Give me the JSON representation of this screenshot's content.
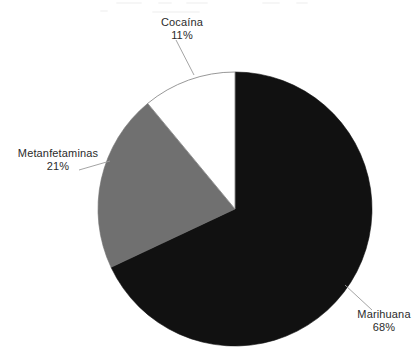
{
  "page": {
    "background_color": "#ffffff",
    "width": 419,
    "height": 359
  },
  "chart_data": {
    "type": "pie",
    "title": "",
    "subtitle": "",
    "xlabel": "",
    "ylabel": "",
    "legend_position": "none",
    "label_style": "outside-with-leader-lines",
    "start_angle_deg": 0,
    "direction": "clockwise",
    "center": {
      "x": 235,
      "y": 209
    },
    "radius": 137,
    "categories": [
      "Marihuana",
      "Metanfetaminas",
      "Cocaína"
    ],
    "values": [
      68,
      21,
      11
    ],
    "value_unit": "%",
    "value_labels": [
      "68%",
      "21%",
      "11%"
    ],
    "colors": [
      "#111111",
      "#707070",
      "#ffffff"
    ],
    "slice_outline_color": "#8c8c8c",
    "slices": [
      {
        "label": "Marihuana",
        "value": 68,
        "value_label": "68%",
        "color": "#111111",
        "start_angle_deg": 0,
        "end_angle_deg": 244.8
      },
      {
        "label": "Metanfetaminas",
        "value": 21,
        "value_label": "21%",
        "color": "#707070",
        "start_angle_deg": 244.8,
        "end_angle_deg": 320.4
      },
      {
        "label": "Cocaína",
        "value": 11,
        "value_label": "11%",
        "color": "#ffffff",
        "start_angle_deg": 320.4,
        "end_angle_deg": 360
      }
    ]
  },
  "labels": {
    "cocaina": {
      "name": "Cocaína",
      "value": "11%"
    },
    "metanfetaminas": {
      "name": "Metanfetaminas",
      "value": "21%"
    },
    "marihuana": {
      "name": "Marihuana",
      "value": "68%"
    }
  },
  "leader_lines": {
    "color": "#9a9a9a"
  }
}
